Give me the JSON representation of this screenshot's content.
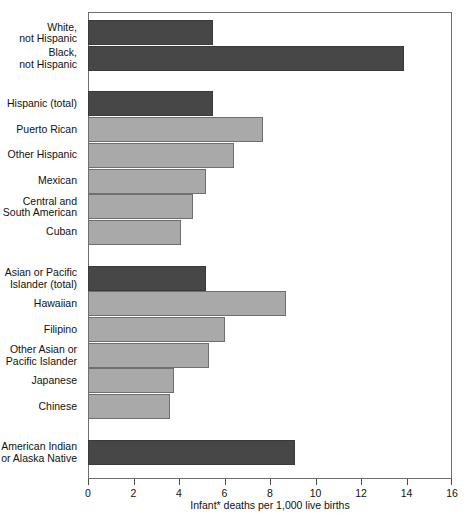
{
  "chart_data": {
    "type": "bar",
    "orientation": "horizontal",
    "title": "",
    "xlabel": "Infant* deaths per 1,000 live births",
    "ylabel": "",
    "xlim": [
      0,
      16
    ],
    "xticks": [
      0,
      2,
      4,
      6,
      8,
      10,
      12,
      14,
      16
    ],
    "xtick_labels": [
      "0",
      "2",
      "4",
      "6",
      "8",
      "10",
      "12",
      "14",
      "16"
    ],
    "grid": false,
    "legend": "none",
    "colors": {
      "group_total": "#474747",
      "subgroup": "#a9a9a9",
      "frame": "#6e6e6e",
      "background": "#ffffff"
    },
    "categories": [
      "White,\nnot Hispanic",
      "Black,\nnot Hispanic",
      "Hispanic (total)",
      "Puerto Rican",
      "Other Hispanic",
      "Mexican",
      "Central and\nSouth American",
      "Cuban",
      "Asian or Pacific\nIslander (total)",
      "Hawaiian",
      "Filipino",
      "Other Asian or\nPacific Islander",
      "Japanese",
      "Chinese",
      "American Indian\nor Alaska Native"
    ],
    "values": [
      5.5,
      13.9,
      5.5,
      7.7,
      6.4,
      5.2,
      4.6,
      4.1,
      5.2,
      8.7,
      6.0,
      5.3,
      3.8,
      3.6,
      9.1
    ],
    "bars": [
      {
        "label": "White,\nnot Hispanic",
        "value": 5.5,
        "shade": "dark",
        "gap_before": 0
      },
      {
        "label": "Black,\nnot Hispanic",
        "value": 13.9,
        "shade": "dark",
        "gap_before": 0
      },
      {
        "label": "Hispanic (total)",
        "value": 5.5,
        "shade": "dark",
        "gap_before": 1
      },
      {
        "label": "Puerto Rican",
        "value": 7.7,
        "shade": "light",
        "gap_before": 0
      },
      {
        "label": "Other Hispanic",
        "value": 6.4,
        "shade": "light",
        "gap_before": 0
      },
      {
        "label": "Mexican",
        "value": 5.2,
        "shade": "light",
        "gap_before": 0
      },
      {
        "label": "Central and\nSouth American",
        "value": 4.6,
        "shade": "light",
        "gap_before": 0
      },
      {
        "label": "Cuban",
        "value": 4.1,
        "shade": "light",
        "gap_before": 0
      },
      {
        "label": "Asian or Pacific\nIslander (total)",
        "value": 5.2,
        "shade": "dark",
        "gap_before": 1
      },
      {
        "label": "Hawaiian",
        "value": 8.7,
        "shade": "light",
        "gap_before": 0
      },
      {
        "label": "Filipino",
        "value": 6.0,
        "shade": "light",
        "gap_before": 0
      },
      {
        "label": "Other Asian or\nPacific Islander",
        "value": 5.3,
        "shade": "light",
        "gap_before": 0
      },
      {
        "label": "Japanese",
        "value": 3.8,
        "shade": "light",
        "gap_before": 0
      },
      {
        "label": "Chinese",
        "value": 3.6,
        "shade": "light",
        "gap_before": 0
      },
      {
        "label": "American Indian\nor Alaska Native",
        "value": 9.1,
        "shade": "dark",
        "gap_before": 1
      }
    ]
  }
}
